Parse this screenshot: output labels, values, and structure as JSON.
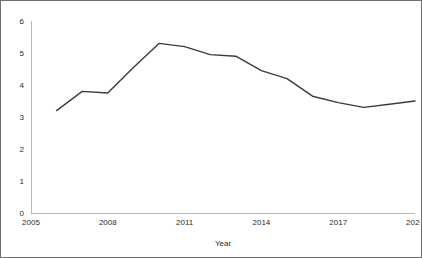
{
  "chart_data": {
    "type": "line",
    "title": "",
    "subtitle": "",
    "xlabel": "Year",
    "ylabel": "",
    "x": [
      2006,
      2007,
      2008,
      2009,
      2010,
      2011,
      2012,
      2013,
      2014,
      2015,
      2016,
      2017,
      2018,
      2019,
      2020
    ],
    "values": [
      3.2,
      3.8,
      3.75,
      4.55,
      5.3,
      5.2,
      4.95,
      4.9,
      4.45,
      4.2,
      3.65,
      3.45,
      3.3,
      3.4,
      3.5
    ],
    "series": [
      {
        "name": "",
        "values": [
          3.2,
          3.8,
          3.75,
          4.55,
          5.3,
          5.2,
          4.95,
          4.9,
          4.45,
          4.2,
          3.65,
          3.45,
          3.3,
          3.4,
          3.5
        ]
      }
    ],
    "xlim": [
      2005,
      2020
    ],
    "ylim": [
      0,
      6
    ],
    "xticks": [
      2005,
      2008,
      2011,
      2014,
      2017,
      2020
    ],
    "xticklabels": [
      "2005",
      "2008",
      "2011",
      "2014",
      "2017",
      "2020"
    ],
    "yticks": [
      0,
      1,
      2,
      3,
      4,
      5,
      6
    ],
    "yticklabels": [
      "0",
      "1",
      "2",
      "3",
      "4",
      "5",
      "6"
    ],
    "grid": false,
    "legend": "none",
    "line_color": "#3b3b3b",
    "background_color": "#ffffff",
    "border_color": "#6f6f6f"
  },
  "axes": {
    "x_title": "Year",
    "y_title": ""
  }
}
